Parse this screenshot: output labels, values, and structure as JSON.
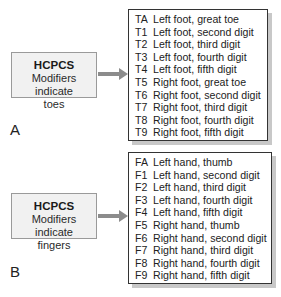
{
  "panels": [
    {
      "label": "A",
      "source": {
        "title": "HCPCS",
        "subtitle_line1": "Modifiers indicate",
        "subtitle_line2": "toes"
      },
      "modifiers": [
        {
          "code": "TA",
          "desc": "Left foot, great toe"
        },
        {
          "code": "T1",
          "desc": "Left foot, second digit"
        },
        {
          "code": "T2",
          "desc": "Left foot, third digit"
        },
        {
          "code": "T3",
          "desc": "Left foot, fourth digit"
        },
        {
          "code": "T4",
          "desc": "Left foot, fifth digit"
        },
        {
          "code": "T5",
          "desc": "Right foot, great toe"
        },
        {
          "code": "T6",
          "desc": "Right foot, second digit"
        },
        {
          "code": "T7",
          "desc": "Right foot, third digit"
        },
        {
          "code": "T8",
          "desc": "Right foot, fourth digit"
        },
        {
          "code": "T9",
          "desc": "Right foot, fifth digit"
        }
      ]
    },
    {
      "label": "B",
      "source": {
        "title": "HCPCS",
        "subtitle_line1": "Modifiers indicate",
        "subtitle_line2": "fingers"
      },
      "modifiers": [
        {
          "code": "FA",
          "desc": "Left hand, thumb"
        },
        {
          "code": "F1",
          "desc": "Left hand, second digit"
        },
        {
          "code": "F2",
          "desc": "Left hand, third digit"
        },
        {
          "code": "F3",
          "desc": "Left hand, fourth digit"
        },
        {
          "code": "F4",
          "desc": "Left hand, fifth digit"
        },
        {
          "code": "F5",
          "desc": "Right hand, thumb"
        },
        {
          "code": "F6",
          "desc": "Right hand, second digit"
        },
        {
          "code": "F7",
          "desc": "Right hand, third digit"
        },
        {
          "code": "F8",
          "desc": "Right hand, fourth digit"
        },
        {
          "code": "F9",
          "desc": "Right hand, fifth digit"
        }
      ]
    }
  ]
}
